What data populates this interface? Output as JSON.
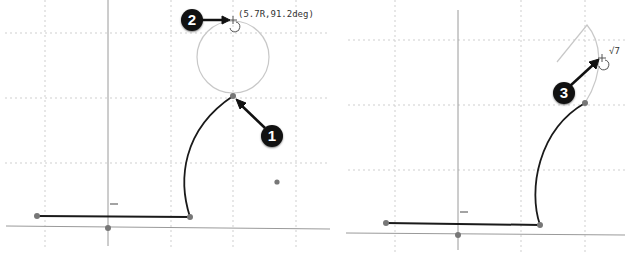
{
  "left_panel": {
    "coordinate_label": "(5.7R,91.2deg)",
    "callouts": [
      {
        "number": "1",
        "target": "arc-endpoint"
      },
      {
        "number": "2",
        "target": "cursor-position"
      }
    ]
  },
  "right_panel": {
    "dimension_label": "√7",
    "callouts": [
      {
        "number": "3",
        "target": "cursor-on-arc"
      }
    ]
  },
  "colors": {
    "grid": "#cfcfcf",
    "axis": "#9a9a9a",
    "sketch_line": "#1a1a1a",
    "preview": "#c8c8c8",
    "point": "#777777",
    "callout_bg": "#111111"
  }
}
